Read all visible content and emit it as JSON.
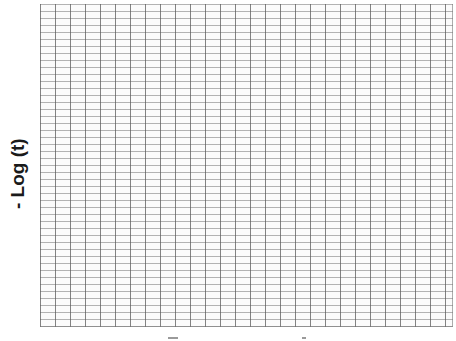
{
  "chart_data": {
    "type": "line",
    "title": "",
    "xlabel": "",
    "ylabel": "- Log (t)",
    "grid": true,
    "grid_spec": {
      "vertical_lines_approx": 28,
      "horizontal_lines_approx": 46,
      "major_spacing_px": [
        15,
        7
      ]
    },
    "series": [],
    "x": [],
    "legend": null
  },
  "axes": {
    "y_label": "- Log (t)"
  }
}
